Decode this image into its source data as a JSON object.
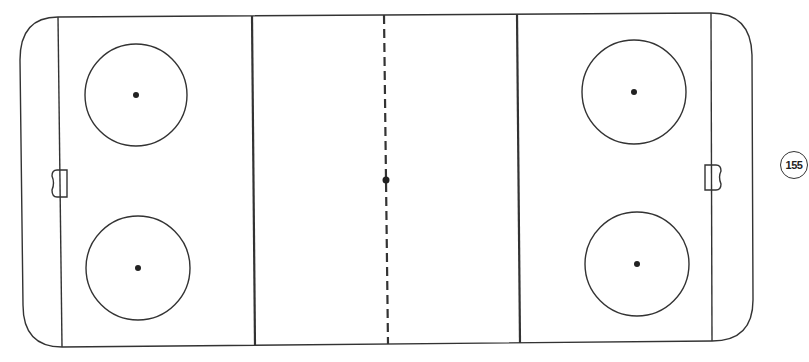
{
  "diagram": {
    "colors": {
      "line": "#333333",
      "background": "#ffffff"
    },
    "rink": {
      "outline": "rounded-rectangle",
      "lines": [
        "left-goal-line",
        "left-blue-line",
        "center-red-line-dashed",
        "right-blue-line",
        "right-goal-line"
      ],
      "faceoff_circles": [
        "top-left",
        "bottom-left",
        "top-right",
        "bottom-right"
      ],
      "center_faceoff_dot": true,
      "goals": [
        "left-goal",
        "right-goal"
      ]
    }
  },
  "page_number": "155"
}
